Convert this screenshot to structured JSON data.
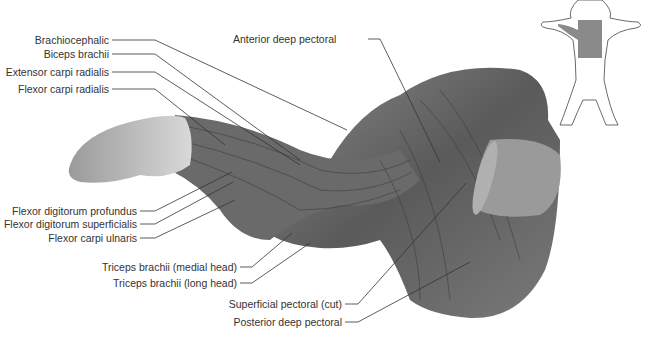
{
  "diagram": {
    "colors": {
      "muscle": "#6e6e6e",
      "muscle_dark": "#3f3f3f",
      "muscle_light": "#b5b5b5",
      "paw": "#c8c8c8",
      "inset_highlight": "#8a8a8a",
      "leader": "#333333"
    },
    "labels_left": [
      {
        "id": "brachiocephalic",
        "text": "Brachiocephalic"
      },
      {
        "id": "biceps-brachii",
        "text": "Biceps brachii"
      },
      {
        "id": "extensor-carpi-radialis",
        "text": "Extensor carpi radialis"
      },
      {
        "id": "flexor-carpi-radialis",
        "text": "Flexor carpi radialis"
      },
      {
        "id": "flexor-digitorum-profundus",
        "text": "Flexor digitorum profundus"
      },
      {
        "id": "flexor-digitorum-superficialis",
        "text": "Flexor digitorum superficialis"
      },
      {
        "id": "flexor-carpi-ulnaris",
        "text": "Flexor carpi ulnaris"
      },
      {
        "id": "triceps-medial",
        "text": "Triceps brachii (medial head)"
      },
      {
        "id": "triceps-long",
        "text": "Triceps brachii (long head)"
      },
      {
        "id": "superficial-pectoral",
        "text": "Superficial pectoral (cut)"
      },
      {
        "id": "posterior-deep-pectoral",
        "text": "Posterior deep pectoral"
      }
    ],
    "labels_top": [
      {
        "id": "anterior-deep-pectoral",
        "text": "Anterior deep pectoral"
      }
    ],
    "inset": {
      "description": "Outline of dog, ventral view, highlighted left forelimb and chest region"
    }
  }
}
